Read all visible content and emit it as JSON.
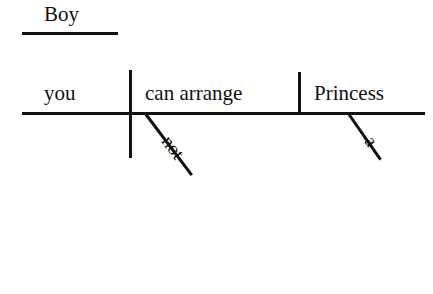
{
  "diagram": {
    "type": "reed-kellogg-sentence-diagram",
    "sentence": "Boy, you can not arrange a Princess.",
    "background_color": "#ffffff",
    "ink_color": "#111111",
    "vocative": {
      "label": "Boy",
      "role": "nominative-of-address",
      "baseline": {
        "x": 22,
        "y": 32,
        "width": 96
      }
    },
    "baseline": {
      "x": 22,
      "y": 112,
      "width": 403
    },
    "slots": [
      {
        "role": "subject",
        "label": "you"
      },
      {
        "role": "verb",
        "label": "can arrange"
      },
      {
        "role": "direct-object",
        "label": "Princess"
      }
    ],
    "dividers": [
      {
        "name": "subject-verb-divider",
        "x": 129,
        "crosses_baseline": true
      },
      {
        "name": "verb-object-divider",
        "x": 298,
        "crosses_baseline": false
      }
    ],
    "modifiers": [
      {
        "label": "not",
        "attaches_to": "verb",
        "angle_deg": 53
      },
      {
        "label": "a",
        "attaches_to": "direct-object",
        "angle_deg": 55
      }
    ]
  }
}
